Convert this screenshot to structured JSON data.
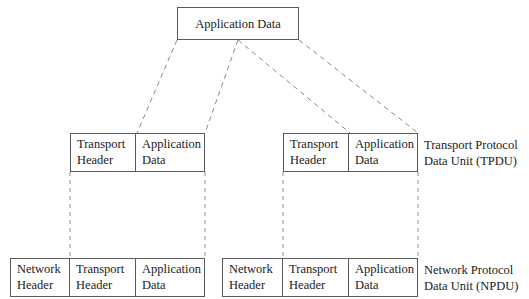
{
  "diagram": {
    "stroke_color": "#5a5a5a",
    "text_color": "#1a1a1a",
    "background_color": "#ffffff"
  },
  "top_box": {
    "cells": [
      {
        "line1": "Application Data",
        "line2": ""
      }
    ]
  },
  "middle_row": {
    "left_box": {
      "cells": [
        {
          "line1": "Transport",
          "line2": "Header"
        },
        {
          "line1": "Application",
          "line2": "Data"
        }
      ]
    },
    "right_box": {
      "cells": [
        {
          "line1": "Transport",
          "line2": "Header"
        },
        {
          "line1": "Application",
          "line2": "Data"
        }
      ]
    },
    "label": {
      "line1": "Transport Protocol",
      "line2": "Data Unit (TPDU)"
    }
  },
  "bottom_row": {
    "left_box": {
      "cells": [
        {
          "line1": "Network",
          "line2": "Header"
        },
        {
          "line1": "Transport",
          "line2": "Header"
        },
        {
          "line1": "Application",
          "line2": "Data"
        }
      ]
    },
    "right_box": {
      "cells": [
        {
          "line1": "Network",
          "line2": "Header"
        },
        {
          "line1": "Transport",
          "line2": "Header"
        },
        {
          "line1": "Application",
          "line2": "Data"
        }
      ]
    },
    "label": {
      "line1": "Network Protocol",
      "line2": "Data Unit (NPDU)"
    }
  }
}
